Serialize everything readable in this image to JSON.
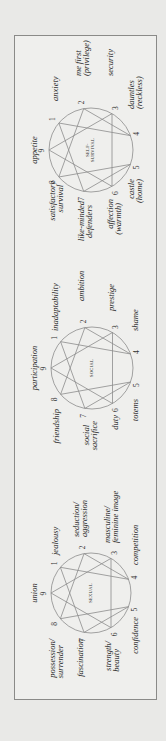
{
  "diagrams": [
    {
      "id": "sexual",
      "center_label": "SEXUAL",
      "labels": {
        "p9": "union",
        "p1": "jealousy",
        "p2a": "seduction/",
        "p2b": "aggression",
        "p3a": "masculine/",
        "p3b": "feminine image",
        "p4": "competition",
        "p5": "confidence",
        "p6a": "strength/",
        "p6b": "beauty",
        "p7": "fascination",
        "p8a": "possession/",
        "p8b": "surrender"
      }
    },
    {
      "id": "social",
      "center_label": "SOCIAL",
      "labels": {
        "p9": "participation",
        "p1": "inadaptability",
        "p2": "ambition",
        "p3": "prestige",
        "p4": "shame",
        "p5": "totems",
        "p6": "duty",
        "p7a": "social",
        "p7b": "sacrifice",
        "p8": "friendship"
      }
    },
    {
      "id": "self-survival",
      "center_label_a": "SELF-",
      "center_label_b": "SURVIVAL",
      "labels": {
        "p9": "appetite",
        "p1": "anxiety",
        "p2a": "me first",
        "p2b": "(privilege)",
        "p3": "security",
        "p4a": "dauntles",
        "p4b": "(reckless)",
        "p5a": "castle",
        "p5b": "(home)",
        "p6a": "affection",
        "p6b": "(warmth)",
        "p7a": "like-minded",
        "p7b": "defenders",
        "p8a": "satisfactory",
        "p8b": "survival"
      }
    }
  ],
  "numbers": [
    "9",
    "1",
    "2",
    "3",
    "4",
    "5",
    "6",
    "7",
    "8"
  ],
  "colors": {
    "background": "#e9e9e7",
    "box": "#efefed",
    "border": "#8a8a88",
    "lines": "#8c8c8c",
    "text": "#262626"
  }
}
